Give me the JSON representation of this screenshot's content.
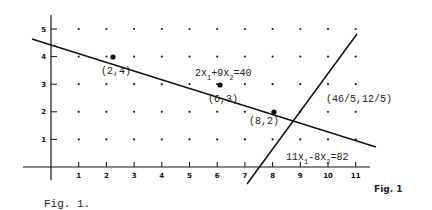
{
  "figure": {
    "caption_bottom_left": "Fig. 1.",
    "caption_right": "Fig. 1"
  },
  "axes": {
    "x_ticks": [
      "1",
      "2",
      "3",
      "4",
      "5",
      "6",
      "7",
      "8",
      "9",
      "10",
      "11"
    ],
    "y_ticks": [
      "1",
      "2",
      "3",
      "4",
      "5"
    ]
  },
  "lines": [
    {
      "label_main": "2x",
      "sub1": "1",
      "mid": "+9x",
      "sub2": "2",
      "rhs": "=40"
    },
    {
      "label_main": "11x",
      "sub1": "1",
      "mid": "-8x",
      "sub2": "2",
      "rhs": "=82"
    }
  ],
  "points": [
    {
      "label": "(2,4)",
      "x": 2,
      "y": 4
    },
    {
      "label": "(6,3)",
      "x": 6,
      "y": 3
    },
    {
      "label": "(8,2)",
      "x": 8,
      "y": 2
    },
    {
      "label": "(46/5,12/5)",
      "x": 9.2,
      "y": 2.4
    }
  ],
  "chart_data": {
    "type": "line",
    "title": "",
    "xlabel": "",
    "ylabel": "",
    "xlim": [
      0,
      11
    ],
    "ylim": [
      0,
      5
    ],
    "grid": "lattice points",
    "lines": [
      {
        "equation": "2x1+9x2=40"
      },
      {
        "equation": "11x1-8x2=82"
      }
    ],
    "highlighted_points": [
      [
        2,
        4
      ],
      [
        6,
        3
      ],
      [
        8,
        2
      ]
    ],
    "intersection": [
      9.2,
      2.4
    ]
  }
}
